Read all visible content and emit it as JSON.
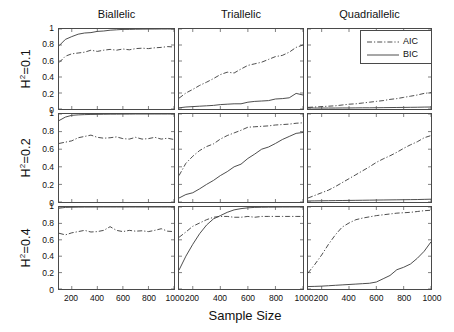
{
  "figure": {
    "xlabel": "Sample Size",
    "column_titles": [
      "Biallelic",
      "Triallelic",
      "Quadriallelic"
    ],
    "row_labels": [
      "H2=0.1",
      "H2=0.2",
      "H2=0.4"
    ],
    "row_labels_display": [
      {
        "base": "H",
        "sup": "2",
        "rest": "=0.1"
      },
      {
        "base": "H",
        "sup": "2",
        "rest": "=0.2"
      },
      {
        "base": "H",
        "sup": "2",
        "rest": "=0.4"
      }
    ],
    "xticks": [
      "200",
      "400",
      "600",
      "800",
      "1000"
    ],
    "yticks": [
      "0",
      "0.2",
      "0.4",
      "0.6",
      "0.8",
      "1"
    ],
    "legend": {
      "position": "top-right",
      "entries": [
        {
          "label": "AIC",
          "style": "dash-dot"
        },
        {
          "label": "BIC",
          "style": "solid"
        }
      ]
    },
    "line_color": "#3a3a3a",
    "axis_color": "#4a4a4a"
  },
  "chart_data": {
    "type": "line",
    "title": "",
    "xlabel": "Sample Size",
    "ylabel": "",
    "xlim": [
      100,
      1000
    ],
    "ylim": [
      0,
      1
    ],
    "grid": false,
    "legend_position": "top-right",
    "legend_entries": [
      "AIC",
      "BIC"
    ],
    "xticks": [
      200,
      400,
      600,
      800,
      1000
    ],
    "yticks": [
      0,
      0.2,
      0.4,
      0.6,
      0.8,
      1
    ],
    "x": [
      100,
      150,
      200,
      250,
      300,
      350,
      400,
      450,
      500,
      550,
      600,
      650,
      700,
      750,
      800,
      850,
      900,
      950,
      1000
    ],
    "panels": [
      {
        "row": "H2=0.1",
        "col": "Biallelic",
        "series": [
          {
            "name": "AIC",
            "style": "dash-dot",
            "values": [
              0.58,
              0.66,
              0.69,
              0.7,
              0.71,
              0.735,
              0.72,
              0.735,
              0.745,
              0.735,
              0.75,
              0.74,
              0.755,
              0.76,
              0.755,
              0.765,
              0.77,
              0.78,
              0.775
            ]
          },
          {
            "name": "BIC",
            "style": "solid",
            "values": [
              0.79,
              0.87,
              0.905,
              0.935,
              0.95,
              0.955,
              0.97,
              0.975,
              0.985,
              0.99,
              0.995,
              0.995,
              0.997,
              0.998,
              0.999,
              0.999,
              1.0,
              1.0,
              1.0
            ]
          }
        ]
      },
      {
        "row": "H2=0.1",
        "col": "Triallelic",
        "series": [
          {
            "name": "AIC",
            "style": "dash-dot",
            "values": [
              0.135,
              0.2,
              0.245,
              0.295,
              0.335,
              0.38,
              0.43,
              0.46,
              0.45,
              0.5,
              0.545,
              0.565,
              0.585,
              0.62,
              0.655,
              0.67,
              0.71,
              0.77,
              0.8
            ]
          },
          {
            "name": "BIC",
            "style": "solid",
            "values": [
              0.015,
              0.025,
              0.03,
              0.035,
              0.04,
              0.045,
              0.055,
              0.06,
              0.065,
              0.065,
              0.085,
              0.095,
              0.1,
              0.105,
              0.125,
              0.13,
              0.14,
              0.195,
              0.175
            ]
          }
        ]
      },
      {
        "row": "H2=0.1",
        "col": "Quadriallelic",
        "series": [
          {
            "name": "AIC",
            "style": "dash-dot",
            "values": [
              0.02,
              0.025,
              0.03,
              0.035,
              0.04,
              0.05,
              0.06,
              0.065,
              0.075,
              0.085,
              0.095,
              0.105,
              0.12,
              0.13,
              0.145,
              0.16,
              0.175,
              0.195,
              0.205
            ]
          },
          {
            "name": "BIC",
            "style": "solid",
            "values": [
              0.015,
              0.012,
              0.012,
              0.012,
              0.012,
              0.013,
              0.013,
              0.014,
              0.015,
              0.015,
              0.016,
              0.017,
              0.018,
              0.019,
              0.02,
              0.021,
              0.022,
              0.024,
              0.025
            ]
          }
        ]
      },
      {
        "row": "H2=0.2",
        "col": "Biallelic",
        "series": [
          {
            "name": "AIC",
            "style": "dash-dot",
            "values": [
              0.665,
              0.68,
              0.695,
              0.73,
              0.745,
              0.76,
              0.735,
              0.725,
              0.73,
              0.74,
              0.72,
              0.715,
              0.735,
              0.715,
              0.72,
              0.735,
              0.715,
              0.725,
              0.71
            ]
          },
          {
            "name": "BIC",
            "style": "solid",
            "values": [
              0.925,
              0.965,
              0.985,
              0.99,
              0.993,
              0.995,
              0.996,
              0.997,
              0.998,
              0.998,
              0.999,
              0.999,
              1.0,
              1.0,
              1.0,
              1.0,
              1.0,
              1.0,
              1.0
            ]
          }
        ]
      },
      {
        "row": "H2=0.2",
        "col": "Triallelic",
        "series": [
          {
            "name": "AIC",
            "style": "dash-dot",
            "values": [
              0.3,
              0.44,
              0.52,
              0.585,
              0.63,
              0.66,
              0.715,
              0.755,
              0.785,
              0.815,
              0.85,
              0.855,
              0.86,
              0.865,
              0.875,
              0.88,
              0.885,
              0.895,
              0.9
            ]
          },
          {
            "name": "BIC",
            "style": "solid",
            "values": [
              0.045,
              0.085,
              0.105,
              0.15,
              0.2,
              0.245,
              0.3,
              0.345,
              0.4,
              0.43,
              0.495,
              0.545,
              0.6,
              0.625,
              0.665,
              0.71,
              0.745,
              0.78,
              0.79
            ]
          }
        ]
      },
      {
        "row": "H2=0.2",
        "col": "Quadriallelic",
        "series": [
          {
            "name": "AIC",
            "style": "dash-dot",
            "values": [
              0.045,
              0.075,
              0.105,
              0.135,
              0.175,
              0.22,
              0.265,
              0.31,
              0.355,
              0.4,
              0.45,
              0.49,
              0.525,
              0.565,
              0.61,
              0.65,
              0.685,
              0.73,
              0.755
            ]
          },
          {
            "name": "BIC",
            "style": "solid",
            "values": [
              0.012,
              0.013,
              0.014,
              0.015,
              0.016,
              0.017,
              0.018,
              0.019,
              0.02,
              0.021,
              0.022,
              0.023,
              0.024,
              0.025,
              0.026,
              0.027,
              0.028,
              0.03,
              0.032
            ]
          }
        ]
      },
      {
        "row": "H2=0.4",
        "col": "Biallelic",
        "series": [
          {
            "name": "AIC",
            "style": "dash-dot",
            "values": [
              0.68,
              0.66,
              0.685,
              0.7,
              0.715,
              0.695,
              0.7,
              0.715,
              0.76,
              0.715,
              0.7,
              0.715,
              0.705,
              0.71,
              0.7,
              0.715,
              0.735,
              0.705,
              0.7
            ]
          },
          {
            "name": "BIC",
            "style": "solid",
            "values": [
              0.985,
              0.995,
              0.997,
              0.998,
              0.999,
              0.999,
              1.0,
              1.0,
              1.0,
              1.0,
              1.0,
              1.0,
              1.0,
              1.0,
              1.0,
              1.0,
              1.0,
              1.0,
              1.0
            ]
          }
        ]
      },
      {
        "row": "H2=0.4",
        "col": "Triallelic",
        "series": [
          {
            "name": "AIC",
            "style": "dash-dot",
            "values": [
              0.63,
              0.695,
              0.765,
              0.805,
              0.845,
              0.875,
              0.885,
              0.885,
              0.875,
              0.875,
              0.885,
              0.875,
              0.885,
              0.885,
              0.885,
              0.885,
              0.885,
              0.885,
              0.885
            ]
          },
          {
            "name": "BIC",
            "style": "solid",
            "values": [
              0.23,
              0.4,
              0.545,
              0.675,
              0.78,
              0.855,
              0.895,
              0.935,
              0.965,
              0.98,
              0.99,
              0.995,
              0.997,
              0.998,
              0.999,
              1.0,
              1.0,
              1.0,
              1.0
            ]
          }
        ]
      },
      {
        "row": "H2=0.4",
        "col": "Quadriallelic",
        "series": [
          {
            "name": "AIC",
            "style": "dash-dot",
            "values": [
              0.195,
              0.3,
              0.415,
              0.545,
              0.66,
              0.755,
              0.805,
              0.845,
              0.865,
              0.88,
              0.895,
              0.905,
              0.915,
              0.925,
              0.93,
              0.935,
              0.945,
              0.955,
              0.96
            ]
          },
          {
            "name": "BIC",
            "style": "solid",
            "values": [
              0.03,
              0.032,
              0.035,
              0.04,
              0.045,
              0.05,
              0.055,
              0.06,
              0.065,
              0.07,
              0.085,
              0.125,
              0.165,
              0.235,
              0.265,
              0.305,
              0.375,
              0.46,
              0.575
            ]
          }
        ]
      }
    ]
  }
}
